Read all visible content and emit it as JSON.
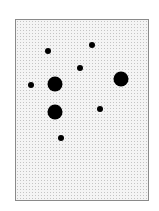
{
  "panel": {
    "border_color": "#8a8a8a",
    "background_color": "#f4f4f4",
    "pattern_color": "#c4c4c4"
  },
  "dots": [
    {
      "x": 48,
      "y": 51,
      "d": 6
    },
    {
      "x": 92,
      "y": 45,
      "d": 6
    },
    {
      "x": 80,
      "y": 68,
      "d": 6
    },
    {
      "x": 31,
      "y": 85,
      "d": 6
    },
    {
      "x": 55,
      "y": 84,
      "d": 15
    },
    {
      "x": 121,
      "y": 79,
      "d": 15
    },
    {
      "x": 55,
      "y": 112,
      "d": 15
    },
    {
      "x": 100,
      "y": 109,
      "d": 6
    },
    {
      "x": 61,
      "y": 138,
      "d": 6
    }
  ],
  "dot_color": "#000000"
}
